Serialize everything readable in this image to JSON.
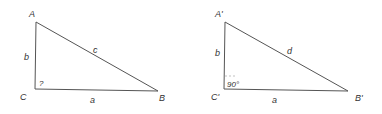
{
  "left_triangle": {
    "vertices": {
      "A": "A",
      "B": "B",
      "C": "C"
    },
    "sides": {
      "a": "a",
      "b": "b",
      "c": "c"
    },
    "angle_C": "?"
  },
  "right_triangle": {
    "vertices": {
      "A": "A'",
      "B": "B'",
      "C": "C'"
    },
    "sides": {
      "a": "a",
      "b": "b",
      "d": "d"
    },
    "angle_C": "90°"
  },
  "colors": {
    "stroke": "#555555",
    "text": "#333333"
  }
}
